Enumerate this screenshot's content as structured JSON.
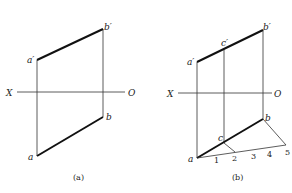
{
  "figure_a": {
    "caption": "(a)",
    "axis": {
      "left_label": "X",
      "right_label": "O"
    },
    "points": {
      "a_prime": "a′",
      "b_prime": "b′",
      "a": "a",
      "b": "b"
    }
  },
  "figure_b": {
    "caption": "(b)",
    "axis": {
      "left_label": "X",
      "right_label": "O"
    },
    "points": {
      "a_prime": "a′",
      "b_prime": "b′",
      "c_prime": "c′",
      "a": "a",
      "b": "b",
      "c": "c"
    },
    "divisions": [
      "1",
      "2",
      "3",
      "4",
      "5"
    ]
  },
  "colors": {
    "line": "#111111",
    "background": "#ffffff"
  }
}
